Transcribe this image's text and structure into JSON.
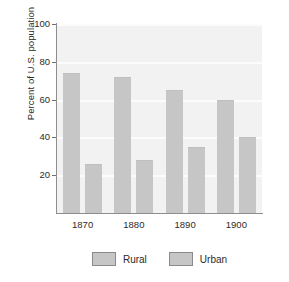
{
  "chart_data": {
    "type": "bar",
    "title": "",
    "subtitle": "",
    "xlabel": "",
    "ylabel": "Percent of U.S. population",
    "categories": [
      "1870",
      "1880",
      "1890",
      "1900"
    ],
    "series": [
      {
        "name": "Rural",
        "values": [
          74,
          72,
          65,
          60
        ],
        "color": "#c6c6c6"
      },
      {
        "name": "Urban",
        "values": [
          26,
          28,
          35,
          40
        ],
        "color": "#c6c6c6"
      }
    ],
    "ylim": [
      0,
      100
    ],
    "yticks": [
      20,
      40,
      60,
      80,
      100
    ],
    "ytick_labels": [
      "20",
      "40",
      "60",
      "80",
      "100"
    ],
    "grid": true,
    "grid_axis": "y",
    "legend": {
      "position": "bottom",
      "entries": [
        "Rural",
        "Urban"
      ]
    },
    "plot_background": "#f2f2f2",
    "gridline_color": "#fcfcfc",
    "axis_color": "#8e8e8e",
    "text_color": "#2b2b2b"
  }
}
